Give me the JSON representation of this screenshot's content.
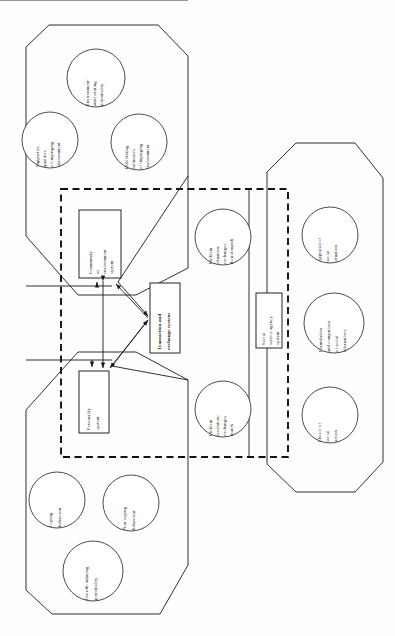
{
  "diagram": {
    "orientation": "rotated-90",
    "palette": {
      "background": "#fefefe",
      "stroke": "#1a1a1a",
      "dashed_stroke": "#111111",
      "fill": "#ffffff"
    },
    "environment_octagon": {
      "name": "impinging-environment-region",
      "circles": [
        {
          "id": "c-env-ameliorating",
          "lines": [
            "Environment-",
            "ameliorating",
            "potentiality"
          ]
        },
        {
          "id": "c-supportive",
          "lines": [
            "Supportive",
            "qualities",
            "of impinging",
            "environment"
          ]
        },
        {
          "id": "c-debilitating",
          "lines": [
            "Debilitating",
            "influences",
            "of impinging",
            "environment"
          ]
        }
      ]
    },
    "person_octagon": {
      "name": "person-behaviour-region",
      "circles": [
        {
          "id": "c-coping",
          "lines": [
            "Coping",
            "behaviour"
          ]
        },
        {
          "id": "c-non-coping",
          "lines": [
            "Non-coping",
            "behaviour"
          ]
        },
        {
          "id": "c-growth",
          "lines": [
            "Growth-inducing",
            "potentiality"
          ]
        }
      ]
    },
    "agency_octagon": {
      "name": "social-service-agency-region",
      "circles": [
        {
          "id": "c-appraisal",
          "lines": [
            "Appraisal of",
            "social",
            "situation"
          ]
        },
        {
          "id": "c-formulation",
          "lines": [
            "Formulation",
            "and comparison",
            "of social",
            "alternatives"
          ]
        },
        {
          "id": "c-choice",
          "lines": [
            "Choice of",
            "social",
            "action"
          ]
        }
      ]
    },
    "dashed_region": {
      "name": "transaction-field-boundary",
      "style": "dashed"
    },
    "boxes": [
      {
        "id": "box-community",
        "lines": [
          "Community",
          "or",
          "environment",
          "system"
        ]
      },
      {
        "id": "box-transaction",
        "lines": [
          "Transaction and",
          "exchange system"
        ]
      },
      {
        "id": "box-personality",
        "lines": [
          "Personality",
          "system"
        ]
      },
      {
        "id": "box-agency",
        "lines": [
          "Social",
          "service agency",
          "system"
        ]
      }
    ],
    "outcome_circles": [
      {
        "id": "c-problem-situation",
        "lines": [
          "Problem",
          "situation:",
          "exchanges",
          "do not match"
        ]
      },
      {
        "id": "c-problem-resolution",
        "lines": [
          "Problem",
          "resolution:",
          "exchanges",
          "match"
        ]
      }
    ],
    "arrows": [
      {
        "id": "arrow-community-to-transaction",
        "from": "box-community",
        "to": "box-transaction"
      },
      {
        "id": "arrow-personality-to-transaction",
        "from": "box-personality",
        "to": "box-transaction"
      },
      {
        "id": "arrow-community-personality-bidirectional",
        "from": "box-community",
        "to": "box-personality",
        "bidirectional": true
      },
      {
        "id": "arrow-environment-to-community",
        "from": "environment-octagon",
        "to": "box-community"
      },
      {
        "id": "arrow-person-to-personality",
        "from": "person-octagon",
        "to": "box-personality"
      }
    ]
  }
}
